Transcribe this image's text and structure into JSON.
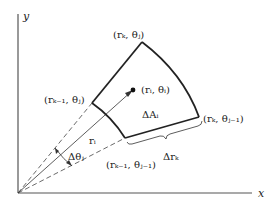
{
  "figure": {
    "axes": {
      "x_label": "x",
      "y_label": "y"
    },
    "labels": {
      "outer_top": "(rₖ, θⱼ)",
      "inner_top": "(rₖ₋₁, θⱼ)",
      "center_point": "(rᵢ, θᵢ)",
      "outer_bottom": "(rₖ, θⱼ₋₁)",
      "inner_bottom": "(rₖ₋₁, θⱼ₋₁)",
      "area": "ΔAᵢ",
      "radius": "rᵢ",
      "angle": "Δθⱼ",
      "radial_width": "Δrₖ"
    },
    "colors": {
      "line": "#222222",
      "axis": "#555555",
      "dashed": "#444444"
    }
  }
}
